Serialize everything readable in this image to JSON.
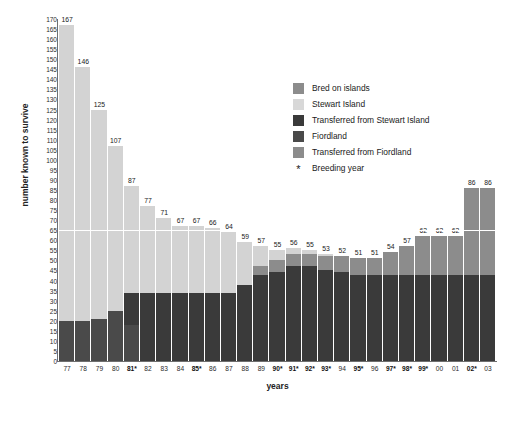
{
  "chart_data": {
    "type": "bar",
    "title": "Trends in kakapo population: 1977–2003",
    "xlabel": "years",
    "ylabel": "number known to survive",
    "ylim": [
      0,
      170
    ],
    "ytick_step": 5,
    "grid": false,
    "reference_line": 65,
    "legend_position": "upper-right-inside",
    "stacked": true,
    "categories": [
      "77",
      "78",
      "79",
      "80",
      "81",
      "82",
      "83",
      "84",
      "85",
      "86",
      "87",
      "88",
      "89",
      "90",
      "91",
      "92",
      "93",
      "94",
      "95",
      "96",
      "97",
      "98",
      "99",
      "00",
      "01",
      "02",
      "03"
    ],
    "tick_labels": [
      "77",
      "78",
      "79",
      "80",
      "81*",
      "82",
      "83",
      "84",
      "85*",
      "86",
      "87",
      "88",
      "89",
      "90*",
      "91*",
      "92*",
      "93*",
      "94",
      "95*",
      "96",
      "97*",
      "98*",
      "99*",
      "00",
      "01",
      "02*",
      "03"
    ],
    "breeding_years": [
      "81*",
      "85*",
      "90*",
      "91*",
      "92*",
      "93*",
      "95*",
      "97*",
      "98*",
      "99*",
      "02*"
    ],
    "totals": [
      167,
      146,
      125,
      107,
      87,
      77,
      71,
      67,
      67,
      66,
      64,
      59,
      57,
      55,
      56,
      55,
      53,
      52,
      51,
      51,
      54,
      57,
      62,
      62,
      62,
      86,
      86
    ],
    "value_labels": [
      "167",
      "146",
      "125",
      "107",
      "87",
      "77",
      "71",
      "67",
      "67",
      "66",
      "64",
      "59",
      "57",
      "55",
      "56",
      "55",
      "53",
      "52",
      "51",
      "51",
      "54",
      "57",
      "62",
      "62",
      "62",
      "86",
      "86"
    ],
    "series": [
      {
        "name": "Fiordland",
        "color": "#4a4a4a",
        "values": [
          20,
          20,
          21,
          25,
          18,
          0,
          0,
          0,
          0,
          0,
          0,
          0,
          0,
          0,
          0,
          0,
          0,
          0,
          0,
          0,
          0,
          0,
          0,
          0,
          0,
          0,
          0
        ]
      },
      {
        "name": "Transferred from Fiordland",
        "color": "#8c8c8c",
        "values": [
          0,
          0,
          0,
          0,
          0,
          0,
          0,
          0,
          0,
          0,
          0,
          0,
          0,
          0,
          0,
          0,
          0,
          0,
          0,
          0,
          0,
          0,
          0,
          0,
          0,
          0,
          0
        ]
      },
      {
        "name": "Transferred from Stewart Island",
        "color": "#3a3a3a",
        "values": [
          0,
          0,
          0,
          0,
          16,
          34,
          34,
          34,
          34,
          34,
          34,
          38,
          43,
          44,
          47,
          47,
          45,
          44,
          43,
          43,
          43,
          43,
          43,
          43,
          43,
          43,
          43
        ]
      },
      {
        "name": "Stewart Island",
        "color": "#d3d3d3",
        "values": [
          147,
          126,
          104,
          82,
          53,
          43,
          37,
          33,
          33,
          32,
          30,
          21,
          10,
          5,
          3,
          2,
          1,
          0,
          0,
          0,
          0,
          0,
          0,
          0,
          0,
          0,
          0
        ]
      },
      {
        "name": "Bred on islands",
        "color": "#8c8c8c",
        "values": [
          0,
          0,
          0,
          0,
          0,
          0,
          0,
          0,
          0,
          0,
          0,
          0,
          4,
          6,
          6,
          6,
          7,
          8,
          8,
          8,
          11,
          14,
          19,
          19,
          19,
          43,
          43
        ]
      }
    ]
  },
  "legend": {
    "items": [
      {
        "label": "Bred on islands",
        "color": "#8c8c8c",
        "marker": "swatch"
      },
      {
        "label": "Stewart Island",
        "color": "#d8d8d8",
        "marker": "swatch"
      },
      {
        "label": "Transferred from Stewart Island",
        "color": "#3a3a3a",
        "marker": "swatch"
      },
      {
        "label": "Fiordland",
        "color": "#4a4a4a",
        "marker": "swatch"
      },
      {
        "label": "Transferred from Fiordland",
        "color": "#8c8c8c",
        "marker": "swatch"
      },
      {
        "label": "Breeding year",
        "color": "#1a1a1a",
        "marker": "asterisk",
        "glyph": "*"
      }
    ]
  }
}
